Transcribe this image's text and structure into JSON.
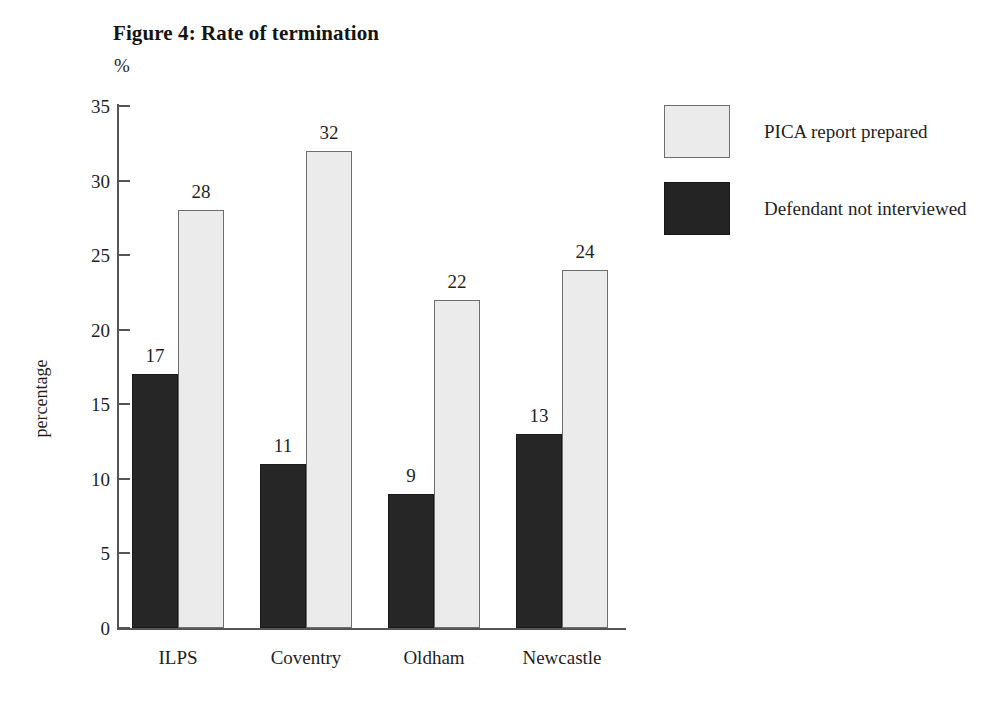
{
  "figure": {
    "title": "Figure 4: Rate of termination",
    "unit": "%"
  },
  "chart_data": {
    "type": "bar",
    "title": "Figure 4: Rate of termination",
    "subtitle": "%",
    "xlabel": "",
    "ylabel": "percentage",
    "ylim": [
      0,
      35
    ],
    "yticks": [
      "0",
      "5",
      "10",
      "15",
      "20",
      "25",
      "30",
      "35"
    ],
    "grid": false,
    "legend_position": "right",
    "categories": [
      "ILPS",
      "Coventry",
      "Oldham",
      "Newcastle"
    ],
    "series": [
      {
        "name": "Defendant not interviewed",
        "color": "#262626",
        "values": [
          17,
          11,
          9,
          13
        ]
      },
      {
        "name": "PICA report prepared",
        "color": "#ebebeb",
        "values": [
          28,
          32,
          22,
          24
        ]
      }
    ]
  },
  "legend": {
    "items": [
      {
        "label": "PICA report prepared",
        "swatch": "light"
      },
      {
        "label": "Defendant not interviewed",
        "swatch": "dark"
      }
    ]
  }
}
